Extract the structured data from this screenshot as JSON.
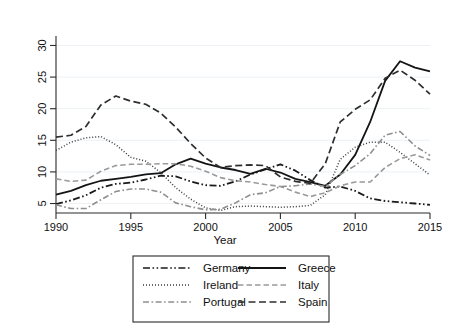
{
  "chart_data": {
    "type": "line",
    "title": "",
    "xlabel": "Year",
    "ylabel": "",
    "xlim": [
      1990,
      2015
    ],
    "ylim": [
      3.5,
      31.5
    ],
    "xticks": [
      1990,
      1995,
      2000,
      2005,
      2010,
      2015
    ],
    "yticks": [
      5,
      10,
      15,
      20,
      25,
      30
    ],
    "grid": true,
    "grid_axis": "y",
    "legend_position": "below-center",
    "x": [
      1990,
      1991,
      1992,
      1993,
      1994,
      1995,
      1996,
      1997,
      1998,
      1999,
      2000,
      2001,
      2002,
      2003,
      2004,
      2005,
      2006,
      2007,
      2008,
      2009,
      2010,
      2011,
      2012,
      2013,
      2014,
      2015
    ],
    "series": [
      {
        "name": "Germany",
        "style": "dash-dot-dot",
        "color": "#1a1a1a",
        "width": 1.8,
        "values": [
          4.9,
          5.5,
          6.3,
          7.5,
          8.1,
          8.3,
          8.8,
          9.4,
          9.3,
          8.5,
          7.9,
          7.8,
          8.5,
          9.6,
          10.4,
          11.2,
          10.2,
          8.7,
          7.5,
          7.7,
          7.0,
          5.8,
          5.4,
          5.2,
          5.0,
          4.8
        ]
      },
      {
        "name": "Greece",
        "style": "solid",
        "color": "#141414",
        "width": 1.8,
        "values": [
          6.4,
          7.0,
          7.9,
          8.6,
          8.9,
          9.2,
          9.6,
          9.8,
          11.2,
          12.1,
          11.3,
          10.7,
          10.3,
          9.7,
          10.5,
          9.9,
          8.9,
          8.4,
          7.8,
          9.6,
          12.7,
          17.9,
          24.4,
          27.5,
          26.5,
          25.9
        ]
      },
      {
        "name": "Ireland",
        "style": "dotted",
        "color": "#3a3a3a",
        "width": 1.5,
        "values": [
          13.4,
          14.7,
          15.4,
          15.6,
          14.3,
          12.3,
          11.7,
          9.9,
          7.5,
          5.7,
          4.3,
          3.9,
          4.5,
          4.6,
          4.5,
          4.4,
          4.5,
          4.7,
          6.4,
          12.0,
          13.9,
          14.7,
          14.7,
          13.1,
          11.3,
          9.5
        ]
      },
      {
        "name": "Italy",
        "style": "long-dash-light",
        "color": "#9a9a9a",
        "width": 1.6,
        "values": [
          8.9,
          8.5,
          8.7,
          10.1,
          11.0,
          11.2,
          11.2,
          11.3,
          11.3,
          10.9,
          10.1,
          9.1,
          8.6,
          8.4,
          8.0,
          7.7,
          6.8,
          6.1,
          6.7,
          7.8,
          8.4,
          8.4,
          10.7,
          12.1,
          12.7,
          11.9
        ]
      },
      {
        "name": "Portugal",
        "style": "dash-dot-light",
        "color": "#8f8f8f",
        "width": 1.6,
        "values": [
          4.8,
          4.2,
          4.2,
          5.6,
          6.9,
          7.3,
          7.3,
          6.8,
          5.1,
          4.5,
          4.0,
          4.1,
          5.1,
          6.4,
          6.7,
          7.7,
          7.8,
          8.1,
          7.7,
          9.6,
          11.0,
          12.9,
          15.8,
          16.4,
          14.1,
          12.6
        ]
      },
      {
        "name": "Spain",
        "style": "dashed",
        "color": "#2e2e2e",
        "width": 1.7,
        "values": [
          15.5,
          15.8,
          17.2,
          20.6,
          22.0,
          21.2,
          20.7,
          19.3,
          17.1,
          14.5,
          12.2,
          10.7,
          11.0,
          11.1,
          11.0,
          9.2,
          8.5,
          8.2,
          11.3,
          17.9,
          19.9,
          21.4,
          24.8,
          26.1,
          24.5,
          22.3
        ]
      }
    ],
    "legend_entries": [
      {
        "label": "Germany",
        "style": "dash-dot-dot",
        "color": "#1a1a1a"
      },
      {
        "label": "Greece",
        "style": "solid",
        "color": "#141414"
      },
      {
        "label": "Ireland",
        "style": "dotted",
        "color": "#3a3a3a"
      },
      {
        "label": "Italy",
        "style": "long-dash-light",
        "color": "#9a9a9a"
      },
      {
        "label": "Portugal",
        "style": "dash-dot-light",
        "color": "#8f8f8f"
      },
      {
        "label": "Spain",
        "style": "dashed",
        "color": "#2e2e2e"
      }
    ]
  }
}
